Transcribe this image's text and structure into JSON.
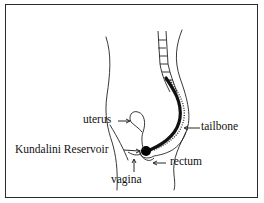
{
  "diagram": {
    "labels": {
      "uterus": "uterus",
      "tailbone": "tailbone",
      "kundalini_reservoir": "Kundalini Reservoir",
      "rectum": "rectum",
      "vagina": "vagina"
    },
    "colors": {
      "ink": "#111111",
      "frame": "#2a2a2a",
      "background": "#ffffff"
    }
  }
}
